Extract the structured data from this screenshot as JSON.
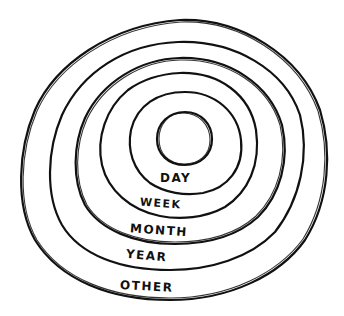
{
  "diagram": {
    "type": "concentric-rings",
    "stroke_color": "#111111",
    "background": "#ffffff",
    "rings": [
      {
        "label": "DAY"
      },
      {
        "label": "WEEK"
      },
      {
        "label": "MONTH"
      },
      {
        "label": "YEAR"
      },
      {
        "label": "OTHER"
      }
    ]
  }
}
